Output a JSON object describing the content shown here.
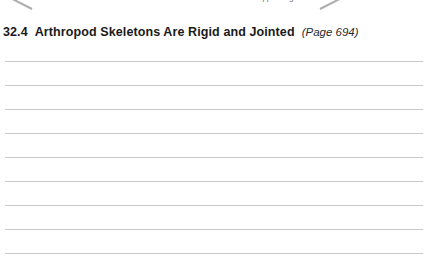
{
  "page": {
    "width": 428,
    "height": 272,
    "background_color": "#ffffff",
    "text_color": "#1a1a1a"
  },
  "figure_remnant": {
    "callout_label": "appendage",
    "label_color": "#6f6f6f",
    "leader_line_color": "#8d8d8d",
    "leader_lines": [
      {
        "name": "leader-line-left",
        "left": 8,
        "top": 8,
        "length": 24,
        "angle_deg": 27
      },
      {
        "name": "leader-line-right",
        "left": 320,
        "top": 8,
        "length": 24,
        "angle_deg": -27
      }
    ]
  },
  "heading": {
    "number": "32.4",
    "title": "Arthropod Skeletons Are Rigid and Jointed",
    "page_reference": "(Page 694)"
  },
  "answer_lines": {
    "count": 9,
    "line_color": "#c9c9c9",
    "spacing_px": 24,
    "first_line_top_px": 9,
    "left_px": 5,
    "width_px": 418,
    "items": [
      {
        "index": 1,
        "value": ""
      },
      {
        "index": 2,
        "value": ""
      },
      {
        "index": 3,
        "value": ""
      },
      {
        "index": 4,
        "value": ""
      },
      {
        "index": 5,
        "value": ""
      },
      {
        "index": 6,
        "value": ""
      },
      {
        "index": 7,
        "value": ""
      },
      {
        "index": 8,
        "value": ""
      },
      {
        "index": 9,
        "value": ""
      }
    ]
  }
}
